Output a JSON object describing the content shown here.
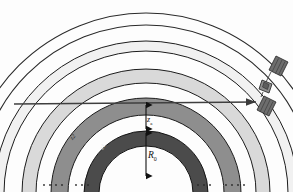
{
  "figure": {
    "kind": "atmospheric-layer-ray-diagram",
    "background": "#fdfdfd",
    "center": {
      "x": 146,
      "y": 193
    },
    "labels": {
      "radius": "R",
      "radius_sub": "0",
      "altitude": "z",
      "altitude_sub": "a",
      "band_inner": "z1",
      "band_outer": "z2"
    },
    "layers": [
      {
        "name": "layer-1-inner",
        "r_inner": 47,
        "r_outer": 62,
        "fill": "#4a4a4a",
        "stroke": "#1c1c1c"
      },
      {
        "name": "layer-2",
        "r_inner": 78,
        "r_outer": 95,
        "fill": "#8c8c8c",
        "stroke": "#1c1c1c"
      },
      {
        "name": "layer-3",
        "r_inner": 110,
        "r_outer": 124,
        "fill": "#d8d8d8",
        "stroke": "#1c1c1c"
      },
      {
        "name": "layer-4-outer",
        "r_inner": 140,
        "r_outer": 152,
        "fill": "#f1f1f1",
        "stroke": "#1c1c1c"
      }
    ],
    "outline_arcs": [
      {
        "name": "arc-outer-1",
        "r": 168,
        "stroke": "#2a2a2a"
      },
      {
        "name": "arc-outer-2",
        "r": 180,
        "stroke": "#2a2a2a"
      }
    ],
    "ray": {
      "name": "ray-line",
      "y": 103,
      "x_start": 14,
      "x_end": 258,
      "stroke": "#3a3a3a",
      "arrow": "right"
    },
    "dimension_arrows": [
      {
        "name": "dim-R0",
        "x": 146,
        "y_top": 131,
        "y_bottom": 176
      },
      {
        "name": "dim-za",
        "x": 146,
        "y_top": 104,
        "y_bottom": 130
      }
    ],
    "dotted_rows": [
      {
        "name": "dots-left-1",
        "x": 48,
        "y": 185,
        "count": 3
      },
      {
        "name": "dots-left-2",
        "x": 80,
        "y": 185,
        "count": 3
      },
      {
        "name": "dots-right-1",
        "x": 196,
        "y": 185,
        "count": 3
      },
      {
        "name": "dots-right-2",
        "x": 230,
        "y": 185,
        "count": 3
      }
    ],
    "satellite": {
      "name": "satellite",
      "x": 272,
      "y": 84,
      "panel_fill": "#6e6e6e",
      "body_fill": "#8a8a8a"
    }
  }
}
